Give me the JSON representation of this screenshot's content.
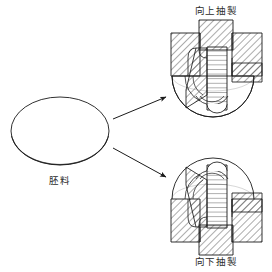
{
  "figure": {
    "title_visible": false,
    "background_color": "#ffffff",
    "line_color": "#1a1a1a",
    "hatch_color": "#333333",
    "width": 272,
    "height": 272
  },
  "labels": {
    "blank": "胚料",
    "upward_draw": "向上抽製",
    "downward_draw": "向下抽製"
  },
  "blank": {
    "name": "胚料",
    "shape": "ellipse",
    "center_x": 60,
    "center_y": 131,
    "radius_x": 49,
    "radius_y": 34,
    "thickness_lines": 2
  },
  "arrows": [
    {
      "name": "arrow-to-upward",
      "from_x": 113,
      "from_y": 119,
      "to_x": 168,
      "to_y": 97,
      "head": "filled-triangle"
    },
    {
      "name": "arrow-to-downward",
      "from_x": 113,
      "from_y": 148,
      "to_x": 168,
      "to_y": 178,
      "head": "filled-triangle"
    }
  ],
  "assemblies": [
    {
      "name": "upward-drawing-assembly",
      "label": "向上抽製",
      "label_position": "top",
      "label_x": 216,
      "label_y": 12,
      "orientation": "up",
      "center_x": 213,
      "components": [
        {
          "part": "upper-punch",
          "hatch": "diagonal-45"
        },
        {
          "part": "left-die-block",
          "hatch": "diagonal-45"
        },
        {
          "part": "right-die-block",
          "hatch": "diagonal-45"
        },
        {
          "part": "drawn-cup-wall",
          "hatch": "horizontal"
        },
        {
          "part": "lower-die-body",
          "hatch": "none"
        },
        {
          "part": "blank-holder",
          "hatch": "diagonal-45"
        }
      ]
    },
    {
      "name": "downward-drawing-assembly",
      "label": "向下抽製",
      "label_position": "bottom",
      "label_x": 216,
      "label_y": 262,
      "orientation": "down",
      "center_x": 213,
      "components": [
        {
          "part": "lower-punch",
          "hatch": "diagonal-45"
        },
        {
          "part": "left-die-block",
          "hatch": "diagonal-45"
        },
        {
          "part": "right-die-block",
          "hatch": "diagonal-45"
        },
        {
          "part": "drawn-cup-wall",
          "hatch": "horizontal"
        },
        {
          "part": "upper-die-body",
          "hatch": "none"
        },
        {
          "part": "blank-holder",
          "hatch": "diagonal-45"
        }
      ]
    }
  ]
}
